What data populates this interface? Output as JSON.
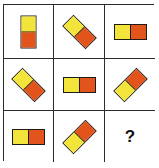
{
  "puzzle": {
    "colors": {
      "yellow": "#F3E43C",
      "orange": "#E2541B",
      "outline": "#1e1a14",
      "grid_line": "#2b2b2b"
    },
    "cells": [
      {
        "row": 1,
        "col": 1,
        "type": "domino",
        "rotation_deg": 90,
        "first_color": "yellow",
        "second_color": "orange",
        "description": "vertical, yellow top, orange bottom"
      },
      {
        "row": 1,
        "col": 2,
        "type": "domino",
        "rotation_deg": 45,
        "first_color": "yellow",
        "second_color": "orange",
        "description": "diagonal, yellow upper-left, orange lower-right"
      },
      {
        "row": 1,
        "col": 3,
        "type": "domino",
        "rotation_deg": 0,
        "first_color": "yellow",
        "second_color": "orange",
        "description": "horizontal, yellow left, orange right"
      },
      {
        "row": 2,
        "col": 1,
        "type": "domino",
        "rotation_deg": 45,
        "first_color": "yellow",
        "second_color": "orange",
        "description": "diagonal, yellow upper-left, orange lower-right"
      },
      {
        "row": 2,
        "col": 2,
        "type": "domino",
        "rotation_deg": 0,
        "first_color": "yellow",
        "second_color": "orange",
        "description": "horizontal, yellow left, orange right"
      },
      {
        "row": 2,
        "col": 3,
        "type": "domino",
        "rotation_deg": -45,
        "first_color": "yellow",
        "second_color": "orange",
        "description": "diagonal, yellow lower-left, orange upper-right"
      },
      {
        "row": 3,
        "col": 1,
        "type": "domino",
        "rotation_deg": 0,
        "first_color": "yellow",
        "second_color": "orange",
        "description": "horizontal, yellow left, orange right"
      },
      {
        "row": 3,
        "col": 2,
        "type": "domino",
        "rotation_deg": -45,
        "first_color": "yellow",
        "second_color": "orange",
        "description": "diagonal, yellow lower-left, orange upper-right"
      },
      {
        "row": 3,
        "col": 3,
        "type": "unknown",
        "label": "?"
      }
    ]
  }
}
